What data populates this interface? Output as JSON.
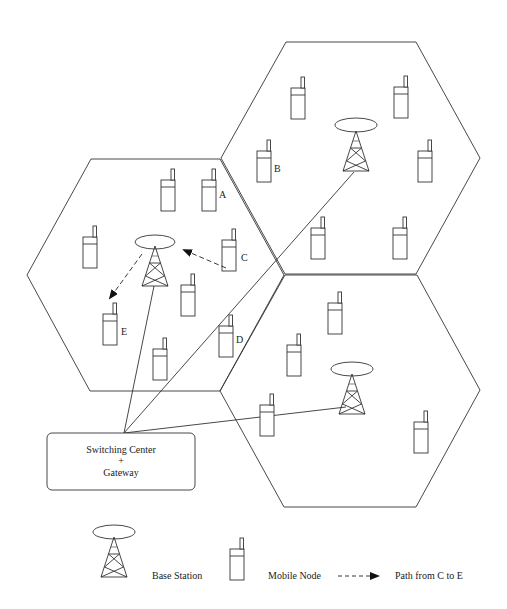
{
  "diagram": {
    "type": "cellular-network",
    "cells": [
      {
        "id": "cell-left",
        "points": [
          [
            91,
            159
          ],
          [
            220,
            159
          ],
          [
            284,
            275
          ],
          [
            220,
            391
          ],
          [
            90,
            391
          ],
          [
            27,
            275
          ]
        ]
      },
      {
        "id": "cell-top",
        "points": [
          [
            286,
            42
          ],
          [
            416,
            42
          ],
          [
            480,
            158
          ],
          [
            416,
            274
          ],
          [
            285,
            274
          ],
          [
            221,
            158
          ]
        ]
      },
      {
        "id": "cell-bottom",
        "points": [
          [
            285,
            275
          ],
          [
            417,
            275
          ],
          [
            480,
            390
          ],
          [
            416,
            507
          ],
          [
            284,
            507
          ],
          [
            220,
            391
          ]
        ]
      }
    ],
    "base_stations": [
      {
        "id": "bs-left",
        "cx": 155,
        "ey": 242,
        "apex": 246,
        "base": 286
      },
      {
        "id": "bs-top",
        "cx": 356,
        "ey": 125,
        "apex": 130,
        "base": 172
      },
      {
        "id": "bs-bottom",
        "cx": 352,
        "ey": 369,
        "apex": 373,
        "base": 415
      }
    ],
    "mobile_nodes": [
      {
        "x": 161,
        "y": 169,
        "label": ""
      },
      {
        "x": 202,
        "y": 169,
        "label": "A"
      },
      {
        "x": 83,
        "y": 226,
        "label": ""
      },
      {
        "x": 222,
        "y": 229,
        "label": "C"
      },
      {
        "x": 181,
        "y": 274,
        "label": ""
      },
      {
        "x": 103,
        "y": 303,
        "label": "E"
      },
      {
        "x": 153,
        "y": 338,
        "label": ""
      },
      {
        "x": 219,
        "y": 315,
        "label": "D"
      },
      {
        "x": 291,
        "y": 77,
        "label": ""
      },
      {
        "x": 394,
        "y": 76,
        "label": ""
      },
      {
        "x": 257,
        "y": 140,
        "label": "B"
      },
      {
        "x": 418,
        "y": 140,
        "label": ""
      },
      {
        "x": 311,
        "y": 217,
        "label": ""
      },
      {
        "x": 393,
        "y": 217,
        "label": ""
      },
      {
        "x": 328,
        "y": 292,
        "label": ""
      },
      {
        "x": 287,
        "y": 334,
        "label": ""
      },
      {
        "x": 260,
        "y": 394,
        "label": ""
      },
      {
        "x": 414,
        "y": 411,
        "label": ""
      }
    ],
    "node_labels": {
      "A": "A",
      "B": "B",
      "C": "C",
      "D": "D",
      "E": "E"
    },
    "switching_center": {
      "line1": "Switching Center",
      "line2": "+",
      "line3": "Gateway"
    },
    "path": {
      "from": "C",
      "to": "E"
    }
  },
  "legend": {
    "base_station": "Base Station",
    "mobile_node": "Mobile Node",
    "path": "Path from C to E"
  }
}
